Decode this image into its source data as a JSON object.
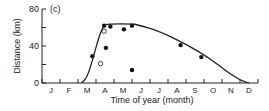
{
  "chart_data": {
    "type": "scatter",
    "panel_label": "(c)",
    "title": "",
    "xlabel": "Time of year (month)",
    "ylabel": "Distance (km)",
    "categories": [
      "J",
      "F",
      "M",
      "A",
      "M",
      "J",
      "J",
      "A",
      "S",
      "O",
      "N",
      "D"
    ],
    "yticks": [
      0,
      40,
      80
    ],
    "ylim": [
      0,
      80
    ],
    "xlim": [
      0,
      12
    ],
    "grid": false,
    "series": [
      {
        "name": "filled points",
        "marker": "filled-circle",
        "points": [
          {
            "x": 2.8,
            "y": 29
          },
          {
            "x": 3.45,
            "y": 62
          },
          {
            "x": 3.55,
            "y": 38
          },
          {
            "x": 3.8,
            "y": 61
          },
          {
            "x": 4.55,
            "y": 58
          },
          {
            "x": 5.0,
            "y": 62
          },
          {
            "x": 5.0,
            "y": 14
          },
          {
            "x": 7.7,
            "y": 41
          },
          {
            "x": 8.85,
            "y": 28
          }
        ]
      },
      {
        "name": "open points",
        "marker": "open-circle",
        "points": [
          {
            "x": 3.45,
            "y": 56
          },
          {
            "x": 3.25,
            "y": 21
          }
        ]
      },
      {
        "name": "fitted curve",
        "marker": "line",
        "points": [
          {
            "x": 2.2,
            "y": 0
          },
          {
            "x": 2.5,
            "y": 6
          },
          {
            "x": 2.8,
            "y": 24
          },
          {
            "x": 3.1,
            "y": 46
          },
          {
            "x": 3.4,
            "y": 62
          },
          {
            "x": 3.7,
            "y": 64
          },
          {
            "x": 5.0,
            "y": 64
          },
          {
            "x": 5.3,
            "y": 63
          },
          {
            "x": 6.5,
            "y": 56
          },
          {
            "x": 8.0,
            "y": 42
          },
          {
            "x": 9.3,
            "y": 27
          },
          {
            "x": 10.3,
            "y": 12
          },
          {
            "x": 11.0,
            "y": 3
          },
          {
            "x": 11.5,
            "y": 0
          }
        ]
      }
    ]
  }
}
